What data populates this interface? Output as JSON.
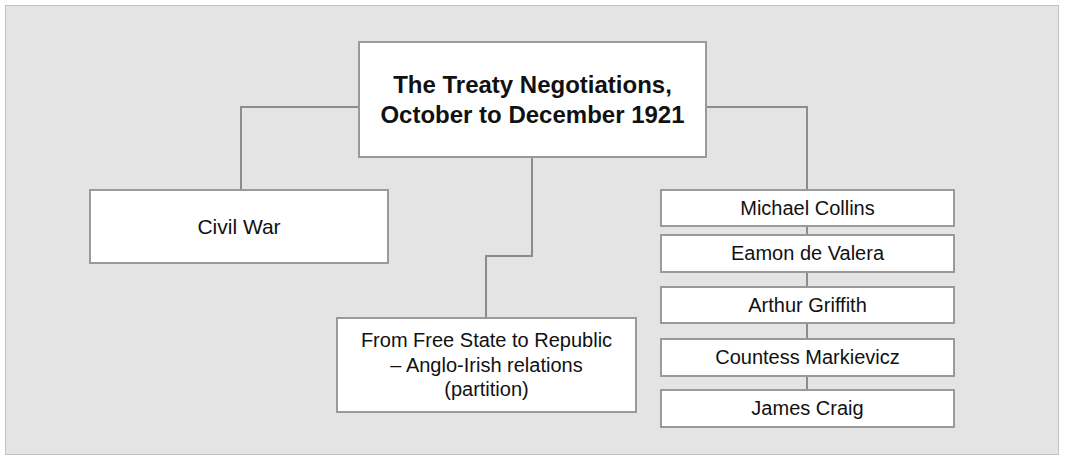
{
  "diagram": {
    "title_node": {
      "lines": [
        "The Treaty Negotiations,",
        "October to December 1921"
      ],
      "line1": "The Treaty Negotiations,",
      "line2": "October to December 1921"
    },
    "branches": [
      {
        "label": "Civil War"
      }
    ],
    "theme_node": {
      "line1": "From Free State to Republic",
      "line2": "– Anglo-Irish relations",
      "line3": "(partition)"
    },
    "people": [
      {
        "name": "Michael Collins"
      },
      {
        "name": "Eamon de Valera"
      },
      {
        "name": "Arthur Griffith"
      },
      {
        "name": "Countess Markievicz"
      },
      {
        "name": "James Craig"
      }
    ]
  },
  "colors": {
    "background": "#e4e4e4",
    "box_fill": "#ffffff",
    "box_border": "#9a9a9a",
    "connector": "#8c8c8c",
    "text": "#111111"
  }
}
